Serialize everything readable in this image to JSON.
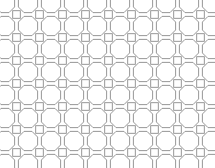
{
  "figure": {
    "name": "octagon-square-tiling",
    "title": "",
    "background_color": "#ffffff",
    "width": 215,
    "height": 168
  },
  "pattern": {
    "type": "truncated-square-tiling",
    "description": "Regular octagons with small squares at the interstices",
    "stroke_color": "#8a8a8a",
    "stroke_width": 0.9,
    "fill_color": "#ffffff",
    "columns": 10,
    "rows": 8,
    "pitch_x": 23.0,
    "pitch_y": 23.0,
    "origin_x": 5.0,
    "origin_y": 3.0,
    "octagon_radius": 10.4,
    "square_size": 7.6,
    "clip": {
      "x": 0,
      "y": 0,
      "width": 215,
      "height": 168
    }
  },
  "chart_data": {
    "type": "diagram",
    "shape_counts": {
      "octagons_per_row": 9,
      "octagon_rows": 7,
      "squares_per_row": 9,
      "square_rows": 7
    }
  }
}
